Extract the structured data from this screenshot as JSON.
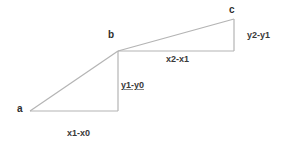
{
  "diagram": {
    "points": {
      "a": {
        "label": "a",
        "x": 30,
        "y": 111
      },
      "b": {
        "label": "b",
        "x": 118,
        "y": 51
      },
      "c": {
        "label": "c",
        "x": 234,
        "y": 19
      }
    },
    "labels": {
      "dx01": "x1-x0",
      "dy01": "y1-y0",
      "dx12": "x2-x1",
      "dy12": "y2-y1"
    },
    "colors": {
      "line": "#b4b4b4",
      "text": "#3a3a3a",
      "background": "#ffffff"
    }
  }
}
